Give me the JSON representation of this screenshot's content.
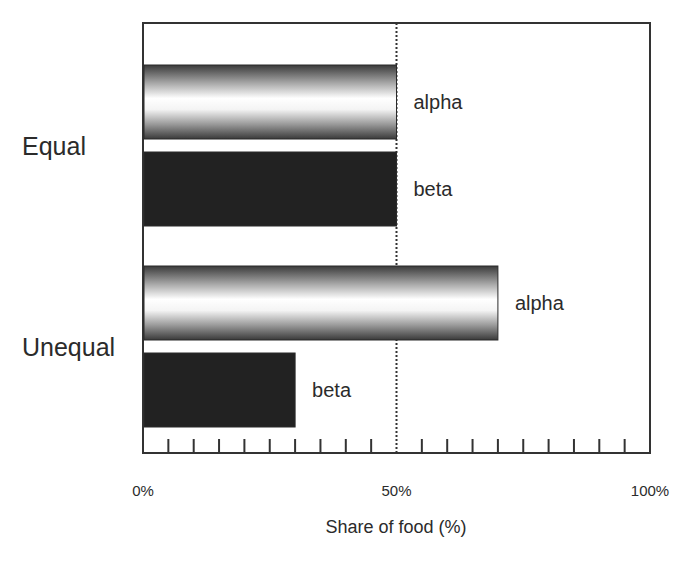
{
  "chart_data": {
    "type": "bar",
    "orientation": "horizontal",
    "title": "",
    "xlabel": "Share of food (%)",
    "ylabel": "",
    "xlim": [
      0,
      100
    ],
    "x_tick_labels": [
      "0%",
      "50%",
      "100%"
    ],
    "minor_tick_count": 18,
    "reference_line": {
      "value": 50,
      "style": "dotted"
    },
    "categories": [
      "Equal",
      "Unequal"
    ],
    "series": [
      {
        "name": "alpha",
        "values": [
          50,
          70
        ],
        "fill": "gradient-metallic"
      },
      {
        "name": "beta",
        "values": [
          50,
          30
        ],
        "fill": "#222222"
      }
    ],
    "bar_labels_shown": true,
    "grid": false,
    "legend": "none (series names labeled next to bars)"
  },
  "colors": {
    "text": "#2b2b2b",
    "axis": "#333333",
    "beta": "#222222",
    "alpha_dark": "#3a3a3a",
    "alpha_light": "#ffffff"
  }
}
